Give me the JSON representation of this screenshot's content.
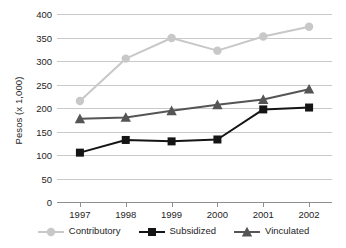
{
  "chart_data": {
    "type": "line",
    "title": "",
    "xlabel": "",
    "ylabel": "Pesos (x 1,000)",
    "categories": [
      "1997",
      "1998",
      "1999",
      "2000",
      "2001",
      "2002"
    ],
    "x": [
      1997,
      1998,
      1999,
      2000,
      2001,
      2002
    ],
    "ylim": [
      0,
      400
    ],
    "yticks": [
      0,
      50,
      100,
      150,
      200,
      250,
      300,
      350,
      400
    ],
    "ytick_labels": [
      "0",
      "50",
      "100",
      "150",
      "200",
      "250",
      "300",
      "350",
      "400"
    ],
    "grid": true,
    "legend_position": "bottom",
    "series": [
      {
        "name": "Contributory",
        "values": [
          215,
          305,
          349,
          322,
          352,
          373
        ],
        "color": "#c8c8c8",
        "marker": "circle"
      },
      {
        "name": "Subsidized",
        "values": [
          105,
          132,
          129,
          133,
          197,
          201
        ],
        "color": "#151515",
        "marker": "square"
      },
      {
        "name": "Vinculated",
        "values": [
          177,
          180,
          194,
          207,
          218,
          240
        ],
        "color": "#555555",
        "marker": "triangle"
      }
    ]
  },
  "axes": {
    "y_title": "Pesos (x 1,000)"
  },
  "colors": {
    "background": "#ffffff",
    "gridline": "#c9c9c9",
    "axis": "#8f8f8f",
    "text": "#1e1e1e",
    "contributory": "#c8c8c8",
    "subsidized": "#151515",
    "vinculated": "#555555"
  }
}
